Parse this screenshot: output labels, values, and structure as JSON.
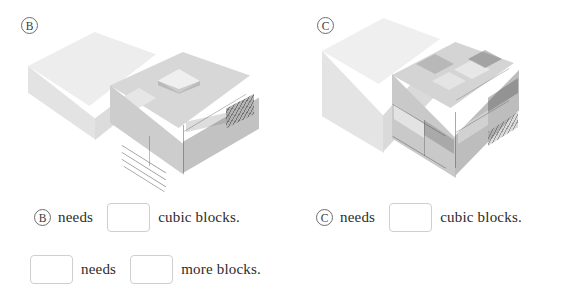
{
  "page": {
    "background": "#ffffff",
    "width": 564,
    "height": 305
  },
  "figures": [
    {
      "id": "figure-b",
      "label": "Ⓑ",
      "letter": "B",
      "description": "A plain light rectangular slab on the left and a textured stepped block cluster on the right"
    },
    {
      "id": "figure-c",
      "label": "Ⓒ",
      "letter": "C",
      "description": "A plain light cube on the left and a textured cube cluster on the right"
    }
  ],
  "rows": [
    {
      "id": "row-b",
      "badge": "Ⓑ",
      "verb": "needs",
      "answer": "",
      "suffix": "cubic blocks."
    },
    {
      "id": "row-c",
      "badge": "Ⓒ",
      "verb": "needs",
      "answer": "",
      "suffix": "cubic blocks."
    },
    {
      "id": "row-compare",
      "subject": "",
      "verb": "needs",
      "answer": "",
      "suffix": "more blocks."
    }
  ],
  "colors": {
    "text": "#2b2b2b",
    "blank_border": "#cfcfcf",
    "badge_border": "#6e6e6e",
    "face_top": "#ececec",
    "face_left": "#dedede",
    "face_right": "#cfcfcf"
  }
}
